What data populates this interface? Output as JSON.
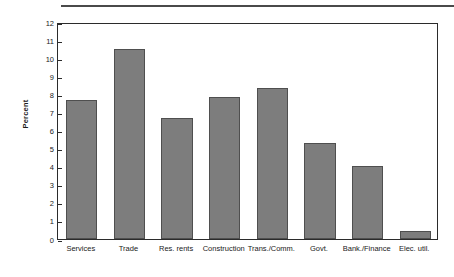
{
  "chart_data": {
    "type": "bar",
    "title": "",
    "xlabel": "",
    "ylabel": "Percent",
    "ylim": [
      0,
      12
    ],
    "ytick_step": 1,
    "yticks": [
      0,
      1,
      2,
      3,
      4,
      5,
      6,
      7,
      8,
      9,
      10,
      11,
      12
    ],
    "ytick_labels": [
      "0",
      "1",
      "2",
      "3",
      "4",
      "5",
      "6",
      "7",
      "8",
      "9",
      "10",
      "11",
      "12"
    ],
    "grid": false,
    "legend": false,
    "categories": [
      "Services",
      "Trade",
      "Res. rents",
      "Construction",
      "Trans./Comm.",
      "Govt.",
      "Bank./Finance",
      "Elec. util."
    ],
    "values": [
      7.7,
      10.5,
      6.7,
      7.85,
      8.35,
      5.3,
      4.05,
      0.45
    ],
    "series": [
      {
        "name": "Percent",
        "values": [
          7.7,
          10.5,
          6.7,
          7.85,
          8.35,
          5.3,
          4.05,
          0.45
        ]
      }
    ],
    "colors": {
      "bar_fill": "#7d7d7d",
      "bar_border": "#4f4f4f",
      "axis": "#2b2b2b",
      "text": "#1a1a1a",
      "background": "#ffffff",
      "top_rule": "#4a4a4a"
    }
  }
}
